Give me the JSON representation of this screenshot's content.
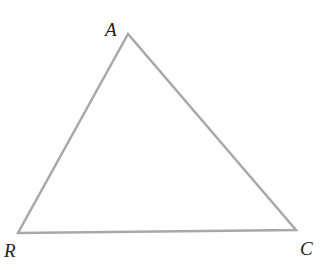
{
  "diagram": {
    "type": "triangle",
    "stroke_color": "#a8a8a8",
    "vertices": [
      {
        "name": "A",
        "label": "A"
      },
      {
        "name": "R",
        "label": "R"
      },
      {
        "name": "C",
        "label": "C"
      }
    ]
  }
}
